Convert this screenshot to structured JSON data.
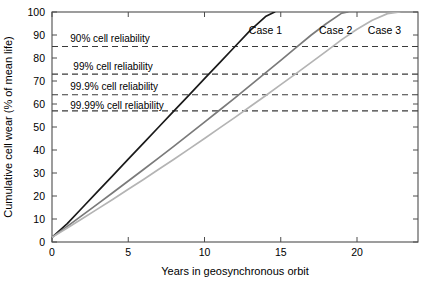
{
  "chart_data": {
    "type": "line",
    "title": "",
    "xlabel": "Years in geosynchronous orbit",
    "ylabel": "Cumulative cell wear (% of mean life)",
    "xlim": [
      0,
      24
    ],
    "ylim": [
      0,
      100
    ],
    "xticks": [
      0,
      5,
      10,
      15,
      20
    ],
    "xtick_labels": [
      "0",
      "5",
      "10",
      "15",
      "20"
    ],
    "yticks": [
      0,
      10,
      20,
      30,
      40,
      50,
      60,
      70,
      80,
      90,
      100
    ],
    "ytick_labels": [
      "0",
      "10",
      "20",
      "30",
      "40",
      "50",
      "60",
      "70",
      "80",
      "90",
      "100"
    ],
    "grid": false,
    "legend_position": "inline-right-of-curves",
    "series": [
      {
        "name": "Case 1",
        "color": "#1a1a1a",
        "label_x": 14.0,
        "label_y": 92,
        "x": [
          0,
          1,
          2,
          3,
          4,
          5,
          6,
          7,
          8,
          9,
          10,
          11,
          12,
          13,
          14,
          14.6
        ],
        "y": [
          2,
          8,
          15,
          22,
          29,
          36,
          43,
          50,
          57,
          64,
          71,
          78,
          85,
          92,
          98,
          100
        ]
      },
      {
        "name": "Case 2",
        "color": "#7a7a7a",
        "label_x": 18.6,
        "label_y": 92,
        "x": [
          0,
          1,
          2,
          3,
          4,
          5,
          6,
          7,
          8,
          9,
          10,
          11,
          12,
          13,
          14,
          15,
          16,
          17,
          18,
          19,
          19.4
        ],
        "y": [
          2,
          6.8,
          11.7,
          16.6,
          21.5,
          26.5,
          31.5,
          36.6,
          41.7,
          46.9,
          52.1,
          57.4,
          62.7,
          68.1,
          73.5,
          79,
          84.5,
          90,
          95,
          99.5,
          100
        ]
      },
      {
        "name": "Case 3",
        "color": "#b4b4b4",
        "label_x": 21.8,
        "label_y": 92,
        "x": [
          0,
          1,
          2,
          3,
          4,
          5,
          6,
          7,
          8,
          9,
          10,
          11,
          12,
          13,
          14,
          15,
          16,
          17,
          18,
          19,
          20,
          21,
          22,
          22.8
        ],
        "y": [
          2,
          6.1,
          10.2,
          14.4,
          18.6,
          22.9,
          27.2,
          31.6,
          36.0,
          40.5,
          45.0,
          49.6,
          54.2,
          58.9,
          63.6,
          68.4,
          73.2,
          78.1,
          83.0,
          88.0,
          92.5,
          96.4,
          99.3,
          100
        ]
      }
    ],
    "reference_lines": [
      {
        "label": "90% cell reliability",
        "value": 85,
        "label_x": 1.2,
        "label_y": 88.5,
        "style": "dashed",
        "color": "#3a3a3a"
      },
      {
        "label": "99% cell reliability",
        "value": 73,
        "label_x": 1.4,
        "label_y": 76.5,
        "style": "dashed",
        "color": "#3a3a3a"
      },
      {
        "label": "99.9% cell reliability",
        "value": 64,
        "label_x": 1.2,
        "label_y": 67.5,
        "style": "dashed",
        "color": "#3a3a3a"
      },
      {
        "label": "99.99% cell reliability",
        "value": 57,
        "label_x": 1.2,
        "label_y": 59.5,
        "style": "dashed",
        "color": "#3a3a3a"
      }
    ]
  }
}
